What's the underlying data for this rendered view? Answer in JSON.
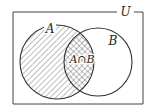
{
  "diagram": {
    "type": "venn",
    "universe_label": "U",
    "sets": [
      {
        "name": "A",
        "label": "A",
        "shading": "diagonal-hatch"
      },
      {
        "name": "B",
        "label": "B",
        "shading": "none"
      }
    ],
    "intersection": {
      "label": "A∩B",
      "shading": "cross-hatch"
    },
    "colors": {
      "stroke": "#333333",
      "background": "#ffffff"
    }
  }
}
